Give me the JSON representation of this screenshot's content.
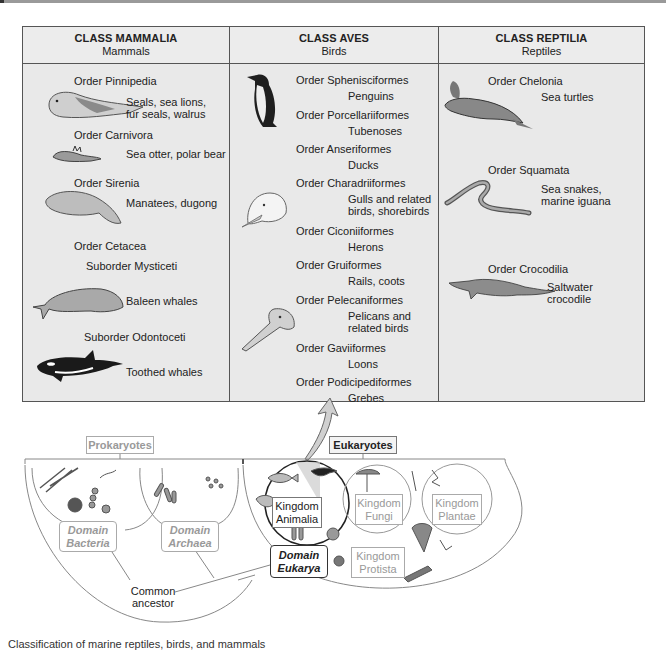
{
  "figure": {
    "table": {
      "columns": [
        {
          "title": "CLASS MAMMALIA",
          "subtitle": "Mammals",
          "entries": [
            {
              "order": "Order Pinnipedia",
              "desc": [
                "Seals, sea lions,",
                "fur seals, walrus"
              ],
              "illustration": "seal-icon"
            },
            {
              "order": "Order Carnivora",
              "desc": [
                "Sea otter, polar bear"
              ],
              "illustration": "sea-otter-icon"
            },
            {
              "order": "Order Sirenia",
              "desc": [
                "Manatees, dugong"
              ],
              "illustration": "manatee-icon"
            },
            {
              "order": "Order Cetacea",
              "suborders": [
                {
                  "name": "Suborder Mysticeti",
                  "desc": "Baleen whales",
                  "illustration": "baleen-whale-icon"
                },
                {
                  "name": "Suborder Odontoceti",
                  "desc": "Toothed whales",
                  "illustration": "orca-icon"
                }
              ]
            }
          ]
        },
        {
          "title": "CLASS AVES",
          "subtitle": "Birds",
          "entries": [
            {
              "order": "Order Sphenisciformes",
              "desc": [
                "Penguins"
              ],
              "illustration": "penguin-icon"
            },
            {
              "order": "Order Porcellariiformes",
              "desc": [
                "Tubenoses"
              ]
            },
            {
              "order": "Order Anseriformes",
              "desc": [
                "Ducks"
              ]
            },
            {
              "order": "Order Charadriiformes",
              "desc": [
                "Gulls and related",
                "birds, shorebirds"
              ],
              "illustration": "gull-head-icon"
            },
            {
              "order": "Order Ciconiiformes",
              "desc": [
                "Herons"
              ]
            },
            {
              "order": "Order Gruiformes",
              "desc": [
                "Rails, coots"
              ]
            },
            {
              "order": "Order Pelecaniformes",
              "desc": [
                "Pelicans and",
                "related birds"
              ],
              "illustration": "pelican-head-icon"
            },
            {
              "order": "Order Gaviiformes",
              "desc": [
                "Loons"
              ]
            },
            {
              "order": "Order Podicipediformes",
              "desc": [
                "Grebes"
              ]
            }
          ]
        },
        {
          "title": "CLASS REPTILIA",
          "subtitle": "Reptiles",
          "entries": [
            {
              "order": "Order Chelonia",
              "desc": [
                "Sea turtles"
              ],
              "illustration": "sea-turtle-icon"
            },
            {
              "order": "Order Squamata",
              "desc": [
                "Sea snakes,",
                "marine iguana"
              ],
              "illustration": "sea-snake-icon"
            },
            {
              "order": "Order Crocodilia",
              "desc": [
                "Saltwater",
                "crocodile"
              ],
              "illustration": "crocodile-icon"
            }
          ]
        }
      ]
    },
    "tree": {
      "prokaryotes_label": "Prokaryotes",
      "eukaryotes_label": "Eukaryotes",
      "domains": [
        {
          "line1": "Domain",
          "line2": "Bacteria"
        },
        {
          "line1": "Domain",
          "line2": "Archaea"
        },
        {
          "line1": "Domain",
          "line2": "Eukarya"
        }
      ],
      "kingdoms": [
        {
          "line1": "Kingdom",
          "line2": "Animalia"
        },
        {
          "line1": "Kingdom",
          "line2": "Fungi"
        },
        {
          "line1": "Kingdom",
          "line2": "Plantae"
        },
        {
          "line1": "Kingdom",
          "line2": "Protista"
        }
      ],
      "root_label": [
        "Common",
        "ancestor"
      ]
    },
    "caption": "Classification of marine reptiles, birds, and mammals"
  },
  "colors": {
    "table_bg": "#e9e9e9",
    "border": "#555555",
    "arrow_fill": "#d0d0d0",
    "grey_label": "#999999"
  }
}
